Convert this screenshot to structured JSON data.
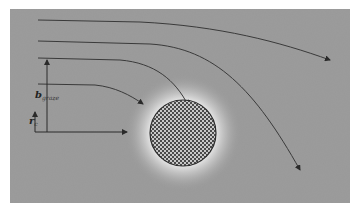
{
  "diagram": {
    "title": "",
    "background_color": "#9c9c9c",
    "panel": {
      "x": 10,
      "y": 9,
      "width": 340,
      "height": 194
    },
    "obstacle": {
      "shape": "circle",
      "cx": 183,
      "cy": 133,
      "r": 33,
      "fill_pattern": "checkerboard",
      "pattern_dark": "#4a4a4a",
      "pattern_light": "#c8c8c8",
      "stroke": "#2a2a2a",
      "halo_color": "#e6e6e6"
    },
    "trajectories": [
      {
        "id": 1,
        "path": "M38,20 L140,22 C220,26 280,42 330,60",
        "arrow_end": [
          330,
          60
        ]
      },
      {
        "id": 2,
        "path": "M38,41 L150,44 C215,48 255,90 300,170",
        "arrow_end": [
          300,
          170
        ]
      },
      {
        "id": 3,
        "path": "M38,58 L120,60 C155,63 175,80 188,105",
        "arrow_end": [
          188,
          105
        ]
      },
      {
        "id": 4,
        "path": "M38,84 L95,85 C115,87 130,95 143,104",
        "arrow_end": [
          143,
          104
        ]
      }
    ],
    "line_color": "#3a3a3a",
    "annotations": {
      "b_graze": {
        "main": "b",
        "subscript": "graze",
        "arrow_x": 47,
        "y_from": 132,
        "y_to": 60,
        "label_x": 35,
        "label_y": 96
      },
      "r_c": {
        "main": "r",
        "subscript": "c",
        "arrow_x": 35,
        "y_from": 132,
        "y_to": 112,
        "label_x": 29,
        "label_y": 122
      },
      "axis": {
        "x_from": 35,
        "x_to": 127,
        "y": 132
      }
    }
  }
}
